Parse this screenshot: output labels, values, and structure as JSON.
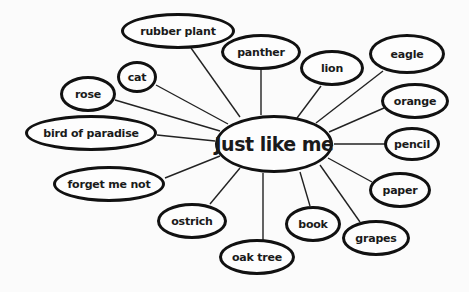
{
  "diagram": {
    "type": "concept-map",
    "center": {
      "label": "Just like me",
      "x": 274,
      "y": 144,
      "w": 118,
      "h": 58
    },
    "nodes": [
      {
        "id": "rubber-plant",
        "label": "rubber plant",
        "x": 178,
        "y": 31,
        "w": 114,
        "h": 36,
        "ax": 240,
        "ay": 117
      },
      {
        "id": "panther",
        "label": "panther",
        "x": 261,
        "y": 52,
        "w": 80,
        "h": 36,
        "ax": 261,
        "ay": 115
      },
      {
        "id": "lion",
        "label": "lion",
        "x": 332,
        "y": 68,
        "w": 64,
        "h": 36,
        "ax": 297,
        "ay": 118
      },
      {
        "id": "eagle",
        "label": "eagle",
        "x": 407,
        "y": 54,
        "w": 76,
        "h": 40,
        "ax": 316,
        "ay": 123
      },
      {
        "id": "orange",
        "label": "orange",
        "x": 415,
        "y": 101,
        "w": 68,
        "h": 36,
        "ax": 329,
        "ay": 132
      },
      {
        "id": "pencil",
        "label": "pencil",
        "x": 412,
        "y": 144,
        "w": 56,
        "h": 34,
        "ax": 334,
        "ay": 144
      },
      {
        "id": "paper",
        "label": "paper",
        "x": 400,
        "y": 190,
        "w": 62,
        "h": 36,
        "ax": 328,
        "ay": 158
      },
      {
        "id": "grapes",
        "label": "grapes",
        "x": 376,
        "y": 238,
        "w": 68,
        "h": 36,
        "ax": 320,
        "ay": 165
      },
      {
        "id": "book",
        "label": "book",
        "x": 306,
        "y": 223,
        "w": 56,
        "h": 36,
        "ax": 300,
        "ay": 172
      },
      {
        "id": "oak-tree",
        "label": "oak tree",
        "x": 257,
        "y": 257,
        "w": 76,
        "h": 36,
        "ax": 263,
        "ay": 173
      },
      {
        "id": "ostrich",
        "label": "ostrich",
        "x": 191,
        "y": 220,
        "w": 70,
        "h": 36,
        "ax": 240,
        "ay": 168
      },
      {
        "id": "forget-me-not",
        "label": "forget me not",
        "x": 109,
        "y": 183,
        "w": 112,
        "h": 36,
        "ax": 220,
        "ay": 156
      },
      {
        "id": "bird-of-paradise",
        "label": "bird of paradise",
        "x": 92,
        "y": 133,
        "w": 132,
        "h": 36,
        "ax": 215,
        "ay": 141
      },
      {
        "id": "rose",
        "label": "rose",
        "x": 88,
        "y": 93,
        "w": 56,
        "h": 36,
        "ax": 220,
        "ay": 131
      },
      {
        "id": "cat",
        "label": "cat",
        "x": 136,
        "y": 77,
        "w": 40,
        "h": 32,
        "ax": 228,
        "ay": 124
      }
    ],
    "colors": {
      "stroke": "#111111",
      "background": "#fbfbfb",
      "text": "#1a1a1a"
    }
  }
}
